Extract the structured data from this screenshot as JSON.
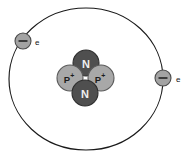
{
  "figure": {
    "name": "atom-model-diagram",
    "background_color": "#ffffff",
    "stroke_color": "#1a1a1a"
  },
  "orbit": {
    "name": "electron-orbit",
    "center_x": 86,
    "center_y": 79,
    "radius_x": 77,
    "radius_y": 71,
    "stroke_color": "#1a1a1a",
    "stroke_width": 1.15
  },
  "nucleus": {
    "center_x": 86,
    "center_y": 79,
    "particles": [
      {
        "id": "neutron-top",
        "type": "neutron",
        "label": "N",
        "cx": 86,
        "cy": 63,
        "r": 13,
        "fill": "#4f4f4f",
        "text_color": "#efefef"
      },
      {
        "id": "proton-left",
        "type": "proton",
        "label": "P",
        "charge": "+",
        "cx": 70,
        "cy": 78,
        "r": 13,
        "fill": "#a8a8a8",
        "text_color": "#1c1c1c"
      },
      {
        "id": "proton-right",
        "type": "proton",
        "label": "P",
        "charge": "+",
        "cx": 101,
        "cy": 78,
        "r": 13,
        "fill": "#a8a8a8",
        "text_color": "#1c1c1c"
      },
      {
        "id": "neutron-bottom",
        "type": "neutron",
        "label": "N",
        "cx": 85,
        "cy": 93,
        "r": 13,
        "fill": "#4f4f4f",
        "text_color": "#efefef"
      }
    ],
    "counts": {
      "protons": 2,
      "neutrons": 2
    }
  },
  "electrons": [
    {
      "id": "electron-upper-left",
      "label": "e",
      "sign": "−",
      "cx": 23,
      "cy": 41,
      "r": 8,
      "fill": "#a3a3a3",
      "label_x": 35,
      "label_y": 42
    },
    {
      "id": "electron-right",
      "label": "e",
      "sign": "−",
      "cx": 163,
      "cy": 78,
      "r": 8,
      "fill": "#a3a3a3",
      "label_x": 176,
      "label_y": 79
    }
  ],
  "legend": {
    "neutron_symbol": "N",
    "proton_symbol": "P",
    "proton_charge": "+",
    "electron_symbol": "e",
    "electron_charge": "−"
  }
}
